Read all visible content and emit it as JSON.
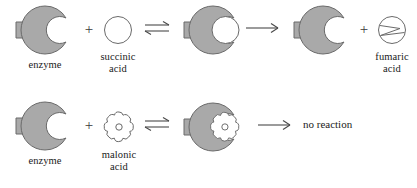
{
  "figure": {
    "background_color": "#ffffff",
    "shape_fill_color": "#a9a9a9",
    "shape_stroke_color": "#5a5a5a",
    "substrate_fill_color": "#ffffff",
    "text_color": "#1a1a1a"
  },
  "row1": {
    "enzyme": {
      "label": "enzyme",
      "icon": "enzyme-shape-icon"
    },
    "plus1": "+",
    "substrate": {
      "label": "succinic\nacid",
      "icon": "circle-substrate-icon"
    },
    "equilibrium_arrow": "⇌",
    "complex": {
      "label": "",
      "icon": "enzyme-substrate-complex-icon"
    },
    "reaction_arrow": "→",
    "enzyme_released": {
      "label": "",
      "icon": "enzyme-shape-icon"
    },
    "plus2": "+",
    "product": {
      "label": "fumaric\nacid",
      "icon": "fumaric-acid-icon"
    }
  },
  "row2": {
    "enzyme": {
      "label": "enzyme",
      "icon": "enzyme-shape-icon"
    },
    "plus1": "+",
    "inhibitor": {
      "label": "malonic\nacid",
      "icon": "malonic-acid-icon"
    },
    "equilibrium_arrow": "⇌",
    "complex": {
      "label": "",
      "icon": "enzyme-inhibitor-complex-icon"
    },
    "reaction_arrow": "→",
    "result_text": "no reaction"
  }
}
